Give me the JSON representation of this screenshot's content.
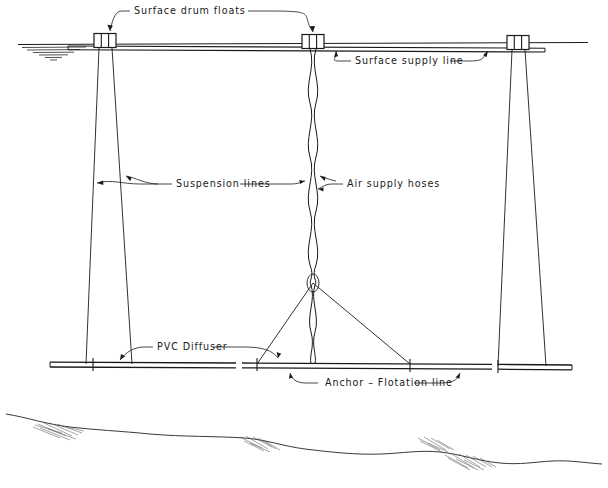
{
  "diagram": {
    "background_color": "#ffffff",
    "line_color": "#1a1a1a",
    "labels": [
      {
        "id": "surface-drum-floats",
        "text": "Surface drum floats",
        "x": 134,
        "y": 11
      },
      {
        "id": "surface-supply-line",
        "text": "Surface supply line",
        "x": 355,
        "y": 61
      },
      {
        "id": "suspension-lines",
        "text": "Suspension lines",
        "x": 176,
        "y": 184
      },
      {
        "id": "air-supply-hoses",
        "text": "Air supply hoses",
        "x": 347,
        "y": 184
      },
      {
        "id": "pvc-diffuser",
        "text": "PVC Diffuser",
        "x": 157,
        "y": 347
      },
      {
        "id": "anchor-flotation-line",
        "text": "Anchor – Flotation line",
        "x": 325,
        "y": 383
      }
    ],
    "components": {
      "water_surface_y": 44,
      "diffuser_line_y": 364,
      "floats_x": [
        105,
        313,
        518
      ],
      "float_label": "drum float",
      "supply_line_label": "supply line",
      "seabed_label": "lake bed profile"
    }
  }
}
